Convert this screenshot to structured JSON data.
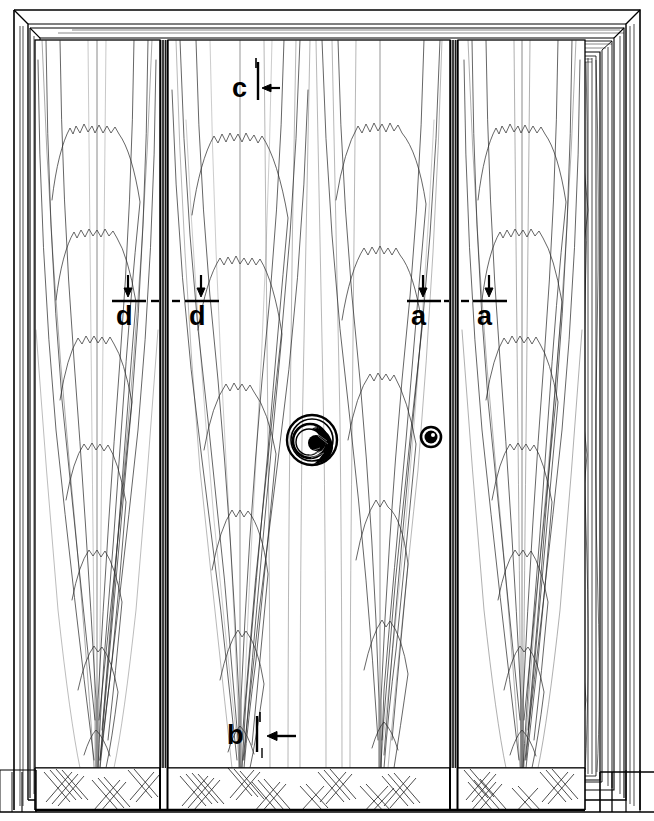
{
  "drawing": {
    "title": "Wood Grain Door Elevation",
    "type": "architectural-line-drawing",
    "background_color": "#ffffff",
    "line_color": "#000000",
    "grain_color": "#333333",
    "width": 654,
    "height": 821
  },
  "frame": {
    "name": "door-casing",
    "mouldings": 4,
    "outer": {
      "x": 12,
      "y": 12,
      "w": 630,
      "h": 795
    },
    "mitred_corners": true
  },
  "panels": [
    {
      "id": "left-leaf",
      "label": "left door leaf",
      "x": 35,
      "y": 40,
      "w": 125,
      "h": 725,
      "grain": "cathedral"
    },
    {
      "id": "center-leaf",
      "label": "center door leaf",
      "x": 168,
      "y": 40,
      "w": 282,
      "h": 725,
      "grain": "cathedral"
    },
    {
      "id": "right-leaf",
      "label": "right door leaf",
      "x": 458,
      "y": 40,
      "w": 127,
      "h": 725,
      "grain": "cathedral"
    }
  ],
  "stiles": [
    {
      "id": "stile-left",
      "x": 160,
      "w": 8
    },
    {
      "id": "stile-right",
      "x": 450,
      "w": 8
    }
  ],
  "hardware": [
    {
      "id": "door-knob",
      "label": "knob",
      "type": "concentric-spiral",
      "cx": 312,
      "cy": 440,
      "r": 25
    },
    {
      "id": "keyhole",
      "label": "escutcheon",
      "type": "ring",
      "cx": 431,
      "cy": 437,
      "r": 10
    }
  ],
  "bottom_rail": {
    "name": "hatched-base-rail",
    "y": 768,
    "h": 42,
    "hatch": "cross-hatch",
    "segments": 3
  },
  "annotations": [
    {
      "id": "ann-c",
      "letter": "c",
      "x": 234,
      "y": 70,
      "marker": "tick-arrow-left",
      "arrow": "left",
      "tick_x": 258,
      "tick_top": 62,
      "tick_bottom": 100,
      "arrow_y": 88
    },
    {
      "id": "ann-d1",
      "letter": "d",
      "x": 117,
      "y": 303,
      "marker": "arrow-down-bar",
      "arrow": "down",
      "bar_x": 112,
      "bar_y": 300,
      "bar_w": 34,
      "dash_side": "right"
    },
    {
      "id": "ann-d2",
      "letter": "d",
      "x": 190,
      "y": 303,
      "marker": "arrow-down-bar",
      "arrow": "down",
      "bar_x": 185,
      "bar_y": 300,
      "bar_w": 34,
      "dash_side": "left"
    },
    {
      "id": "ann-a1",
      "letter": "a",
      "x": 412,
      "y": 303,
      "marker": "arrow-down-bar",
      "arrow": "down",
      "bar_x": 407,
      "bar_y": 300,
      "bar_w": 34,
      "dash_side": "right"
    },
    {
      "id": "ann-a2",
      "letter": "a",
      "x": 478,
      "y": 303,
      "marker": "arrow-down-bar",
      "arrow": "down",
      "bar_x": 473,
      "bar_y": 300,
      "bar_w": 34,
      "dash_side": "left"
    },
    {
      "id": "ann-b",
      "letter": "b",
      "x": 228,
      "y": 725,
      "marker": "tick-arrow-left",
      "arrow": "left",
      "tick_x": 257,
      "tick_top": 716,
      "tick_bottom": 752,
      "arrow_y": 736
    }
  ],
  "labels": {
    "a": "a",
    "b": "b",
    "c": "c",
    "d": "d"
  }
}
